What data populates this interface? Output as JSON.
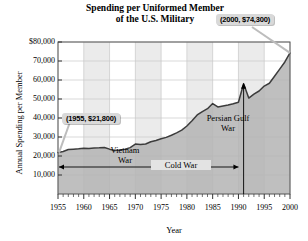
{
  "chart_data": {
    "type": "area",
    "title": "Spending per Uniformed Member of the U.S. Military",
    "title_line1": "Spending per Uniformed Member",
    "title_line2": "of the U.S. Military",
    "xlabel": "Year",
    "ylabel": "Annual Spending per Member",
    "xlim": [
      1955,
      2000
    ],
    "ylim": [
      0,
      80000
    ],
    "xticks": [
      1955,
      1960,
      1965,
      1970,
      1975,
      1980,
      1985,
      1990,
      1995,
      2000
    ],
    "xtick_labels": [
      "1955",
      "1960",
      "1965",
      "1970",
      "1975",
      "1980",
      "1985",
      "1990",
      "1995",
      "2000"
    ],
    "yticks": [
      10000,
      20000,
      30000,
      40000,
      50000,
      60000,
      70000,
      80000
    ],
    "ytick_labels": [
      "10,000",
      "20,000",
      "30,000",
      "40,000",
      "50,000",
      "60,000",
      "70,000",
      "$80,000"
    ],
    "grid": true,
    "legend": "none",
    "series_name": "Annual spending per uniformed member",
    "fill_color": "#b4b4b4",
    "line_color": "#3c3c3c",
    "x": [
      1955,
      1956,
      1957,
      1958,
      1959,
      1960,
      1961,
      1962,
      1963,
      1964,
      1965,
      1966,
      1967,
      1968,
      1969,
      1970,
      1971,
      1972,
      1973,
      1974,
      1975,
      1976,
      1977,
      1978,
      1979,
      1980,
      1981,
      1982,
      1983,
      1984,
      1985,
      1986,
      1987,
      1988,
      1989,
      1990,
      1991,
      1992,
      1993,
      1994,
      1995,
      1996,
      1997,
      1998,
      1999,
      2000
    ],
    "values": [
      21800,
      22400,
      23400,
      23600,
      23800,
      24100,
      24000,
      24200,
      24300,
      24500,
      23600,
      22900,
      23100,
      23600,
      24400,
      26300,
      26100,
      26300,
      27500,
      28200,
      29100,
      29800,
      30900,
      32200,
      33600,
      35800,
      38600,
      41600,
      43400,
      44900,
      47600,
      45800,
      46300,
      46800,
      47500,
      48300,
      58000,
      50500,
      52600,
      54200,
      56800,
      58300,
      62000,
      65700,
      69500,
      74300
    ],
    "annotations": [
      {
        "name": "point-2000",
        "text": "(2000, $74,300)",
        "x": 2000,
        "y": 74300
      },
      {
        "name": "point-1955",
        "text": "(1955, $21,800)",
        "x": 1955,
        "y": 21800
      },
      {
        "name": "vietnam-war",
        "text_line1": "Vietnam",
        "text_line2": "War"
      },
      {
        "name": "persian-gulf-war",
        "text_line1": "Persian Gulf",
        "text_line2": "War"
      },
      {
        "name": "cold-war",
        "text": "Cold War"
      }
    ]
  },
  "chart": {
    "title_line1": "Spending per Uniformed Member",
    "title_line2": "of the U.S. Military",
    "y_axis_title": "Annual Spending per Member",
    "x_axis_title": "Year",
    "callout_2000": "(2000, $74,300)",
    "callout_1955": "(1955, $21,800)",
    "vietnam_line1": "Vietnam",
    "vietnam_line2": "War",
    "gulf_line1": "Persian Gulf",
    "gulf_line2": "War",
    "cold_war": "Cold War"
  }
}
